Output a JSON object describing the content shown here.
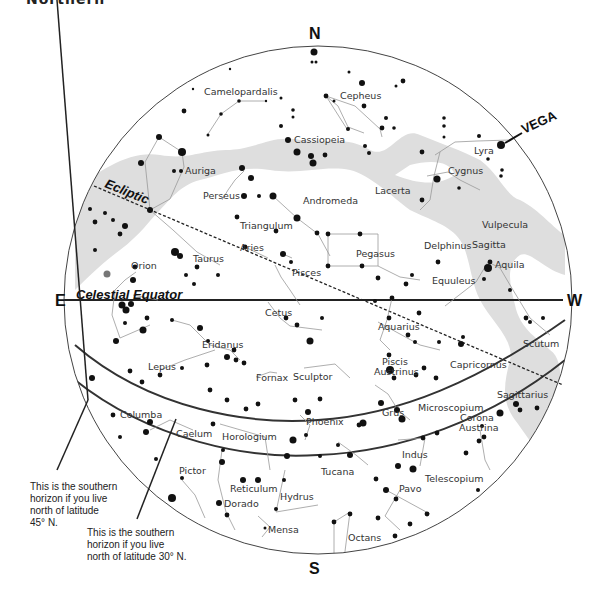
{
  "header": {
    "cut_title": "Northern"
  },
  "directions": {
    "north": "N",
    "south": "S",
    "east": "E",
    "west": "W"
  },
  "lines": {
    "celestial_equator": "Celestial Equator",
    "ecliptic": "Ecliptic"
  },
  "highlight_star": {
    "label": "VEGA"
  },
  "horizon_notes": {
    "lat45": [
      "This is the southern",
      "horizon if you live",
      "north of latitude",
      "45° N."
    ],
    "lat30": [
      "This is the southern",
      "horizon if you live",
      "north of latitude 30° N."
    ]
  },
  "constellations": [
    {
      "name": "Camelopardalis",
      "x": 204,
      "y": 95
    },
    {
      "name": "Cepheus",
      "x": 340,
      "y": 99
    },
    {
      "name": "Cassiopeia",
      "x": 294,
      "y": 143
    },
    {
      "name": "Lyra",
      "x": 474,
      "y": 154
    },
    {
      "name": "Cygnus",
      "x": 448,
      "y": 174
    },
    {
      "name": "Auriga",
      "x": 185,
      "y": 174
    },
    {
      "name": "Perseus",
      "x": 203,
      "y": 199
    },
    {
      "name": "Andromeda",
      "x": 303,
      "y": 204
    },
    {
      "name": "Lacerta",
      "x": 375,
      "y": 194
    },
    {
      "name": "Triangulum",
      "x": 240,
      "y": 229
    },
    {
      "name": "Vulpecula",
      "x": 482,
      "y": 228
    },
    {
      "name": "Sagitta",
      "x": 472,
      "y": 248
    },
    {
      "name": "Delphinus",
      "x": 424,
      "y": 249
    },
    {
      "name": "Aries",
      "x": 240,
      "y": 251
    },
    {
      "name": "Pegasus",
      "x": 356,
      "y": 257
    },
    {
      "name": "Aquila",
      "x": 495,
      "y": 268
    },
    {
      "name": "Taurus",
      "x": 193,
      "y": 262
    },
    {
      "name": "Orion",
      "x": 131,
      "y": 269
    },
    {
      "name": "Pisces",
      "x": 292,
      "y": 276
    },
    {
      "name": "Equuleus",
      "x": 432,
      "y": 284
    },
    {
      "name": "Cetus",
      "x": 265,
      "y": 316
    },
    {
      "name": "Aquarius",
      "x": 378,
      "y": 330
    },
    {
      "name": "Eridanus",
      "x": 202,
      "y": 348
    },
    {
      "name": "Scutum",
      "x": 523,
      "y": 347
    },
    {
      "name": "Lepus",
      "x": 148,
      "y": 370
    },
    {
      "name": "Piscis",
      "x": 382,
      "y": 365
    },
    {
      "name": "Austrinus",
      "x": 374,
      "y": 375
    },
    {
      "name": "Capricornus",
      "x": 450,
      "y": 368
    },
    {
      "name": "Fornax",
      "x": 256,
      "y": 381
    },
    {
      "name": "Sculptor",
      "x": 293,
      "y": 380
    },
    {
      "name": "Sagittarius",
      "x": 497,
      "y": 398
    },
    {
      "name": "Columba",
      "x": 120,
      "y": 418
    },
    {
      "name": "Microscopium",
      "x": 418,
      "y": 411
    },
    {
      "name": "Grus",
      "x": 382,
      "y": 416
    },
    {
      "name": "Phoenix",
      "x": 306,
      "y": 425
    },
    {
      "name": "Corona",
      "x": 460,
      "y": 421
    },
    {
      "name": "Austrina",
      "x": 459,
      "y": 431
    },
    {
      "name": "Caelum",
      "x": 176,
      "y": 437
    },
    {
      "name": "Horologium",
      "x": 222,
      "y": 440
    },
    {
      "name": "Indus",
      "x": 402,
      "y": 458
    },
    {
      "name": "Tucana",
      "x": 321,
      "y": 475
    },
    {
      "name": "Pictor",
      "x": 179,
      "y": 474
    },
    {
      "name": "Reticulum",
      "x": 230,
      "y": 492
    },
    {
      "name": "Pavo",
      "x": 399,
      "y": 492
    },
    {
      "name": "Telescopium",
      "x": 425,
      "y": 482
    },
    {
      "name": "Hydrus",
      "x": 280,
      "y": 500
    },
    {
      "name": "Dorado",
      "x": 224,
      "y": 507
    },
    {
      "name": "Mensa",
      "x": 268,
      "y": 533
    },
    {
      "name": "Octans",
      "x": 348,
      "y": 541
    }
  ],
  "colors": {
    "milky_way": "#dedede",
    "stars": "#111111",
    "lines": "#999999",
    "circle": "#444444",
    "betelgeuse": "#777777"
  }
}
